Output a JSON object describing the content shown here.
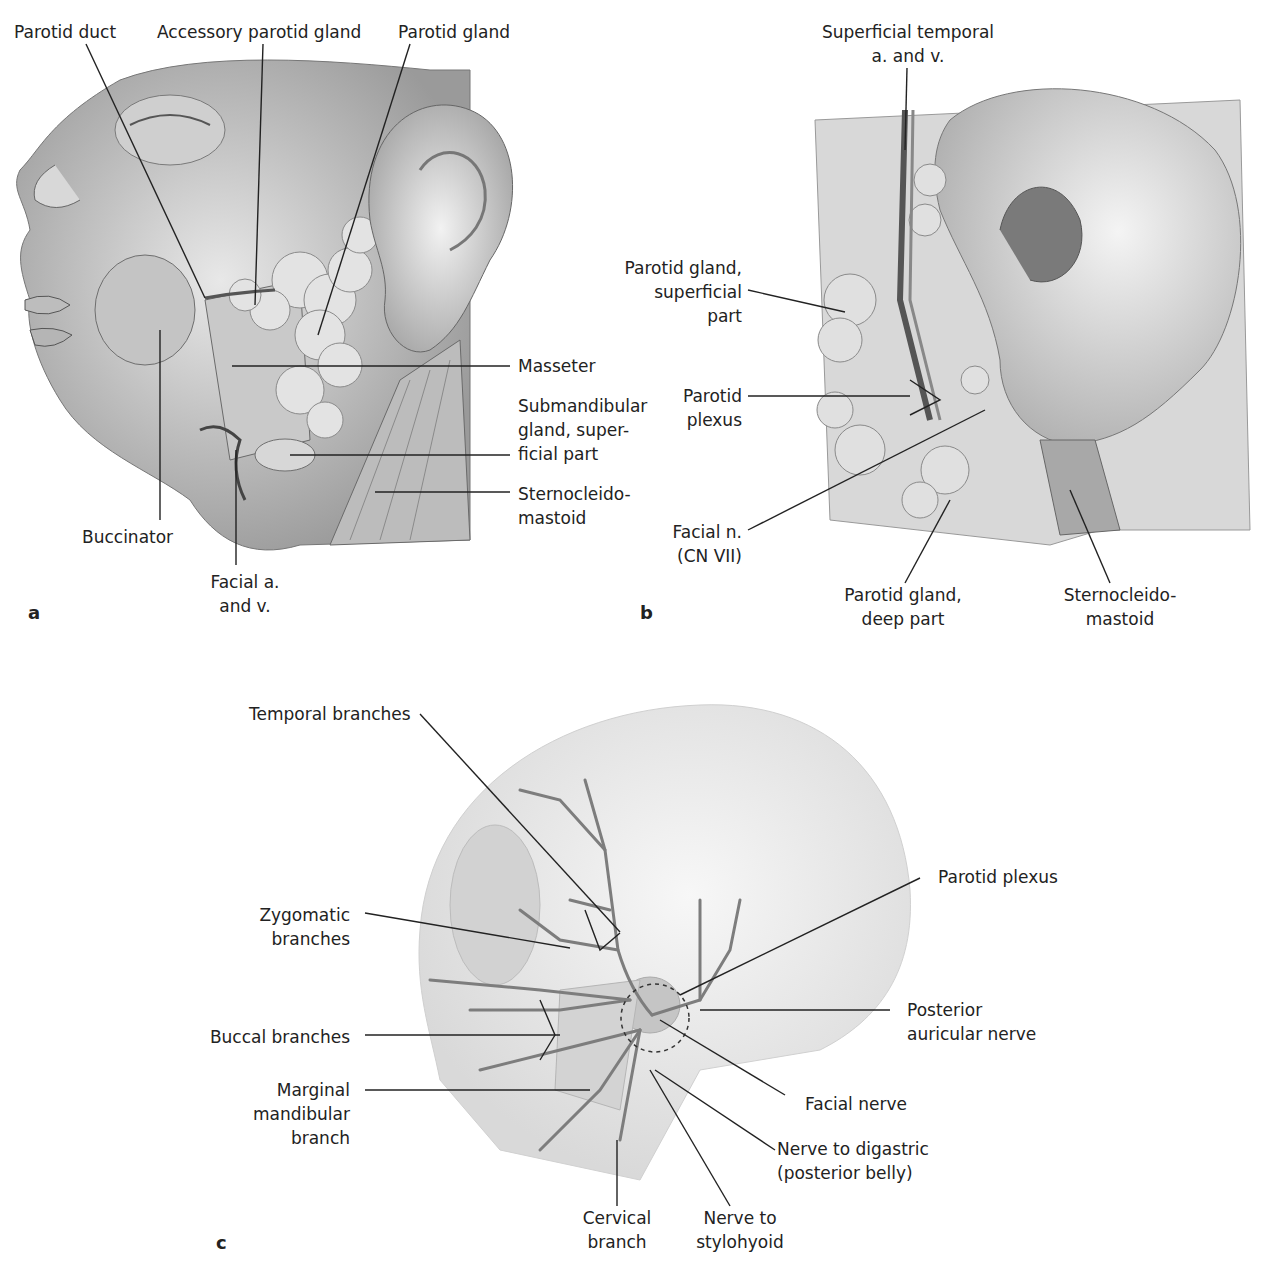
{
  "figure": {
    "panels": [
      {
        "id": "a",
        "letter": "a",
        "subject": "lateral face dissection with parotid gland",
        "labels": {
          "parotid_duct": "Parotid duct",
          "accessory_parotid_gland": "Accessory parotid gland",
          "parotid_gland": "Parotid gland",
          "masseter": "Masseter",
          "submandibular": "Submandibular\ngland, super-\nficial part",
          "sternocleidomastoid": "Sternocleido-\nmastoid",
          "buccinator": "Buccinator",
          "facial_av": "Facial a.\nand v."
        }
      },
      {
        "id": "b",
        "letter": "b",
        "subject": "parotid region near ear",
        "labels": {
          "superficial_temporal": "Superficial temporal\na. and v.",
          "parotid_superficial": "Parotid gland,\nsuperficial\npart",
          "parotid_plexus": "Parotid\nplexus",
          "facial_n": "Facial n.\n(CN VII)",
          "parotid_deep": "Parotid gland,\ndeep part",
          "sternocleidomastoid": "Sternocleido-\nmastoid"
        }
      },
      {
        "id": "c",
        "letter": "c",
        "subject": "facial nerve branches over skull",
        "labels": {
          "temporal": "Temporal branches",
          "zygomatic": "Zygomatic\nbranches",
          "buccal": "Buccal branches",
          "marginal_mandibular": "Marginal\nmandibular\nbranch",
          "cervical": "Cervical\nbranch",
          "stylohyoid": "Nerve to\nstylohyoid",
          "digastric": "Nerve to digastric\n(posterior belly)",
          "facial_nerve": "Facial nerve",
          "posterior_auricular": "Posterior\nauricular nerve",
          "parotid_plexus": "Parotid plexus"
        }
      }
    ]
  }
}
